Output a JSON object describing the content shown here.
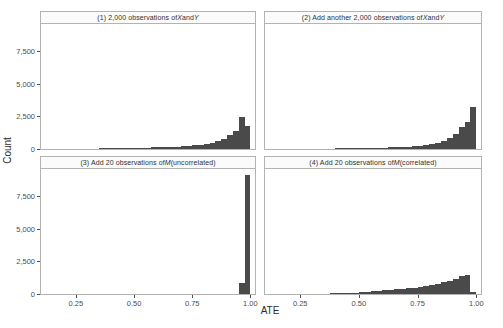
{
  "chart_data": {
    "type": "bar",
    "title": "",
    "xlabel": "ATE",
    "ylabel": "Count",
    "xlim": [
      0.1,
      1.02
    ],
    "ylim": [
      0,
      9600
    ],
    "grid": false,
    "legend": "none",
    "facet_layout": "2x2",
    "x_ticks": [
      0.25,
      0.5,
      0.75,
      1.0
    ],
    "x_tick_labels": [
      "0.25",
      "0.50",
      "0.75",
      "1.00"
    ],
    "y_ticks": [
      0,
      2500,
      5000,
      7500
    ],
    "y_tick_labels": [
      "0",
      "2,500",
      "5,000",
      "7,500"
    ],
    "bar_color": "#4a4a4a",
    "panels": [
      {
        "id": "panel-1",
        "title_prefix": "(1) 2,000 observations of ",
        "title_italic_1": "X",
        "title_mid": " and ",
        "title_italic_2": "Y",
        "title_suffix": "",
        "title_plain": "(1) 2,000 observations of X and Y",
        "bin_width": 0.025,
        "bin_starts": [
          0.35,
          0.375,
          0.4,
          0.425,
          0.45,
          0.475,
          0.5,
          0.525,
          0.55,
          0.575,
          0.6,
          0.625,
          0.65,
          0.675,
          0.7,
          0.725,
          0.75,
          0.775,
          0.8,
          0.825,
          0.85,
          0.875,
          0.9,
          0.925,
          0.95,
          0.975
        ],
        "values": [
          30,
          40,
          55,
          60,
          70,
          80,
          90,
          100,
          110,
          120,
          135,
          150,
          165,
          185,
          210,
          240,
          280,
          330,
          400,
          500,
          620,
          800,
          1050,
          1400,
          2450,
          1800
        ]
      },
      {
        "id": "panel-2",
        "title_prefix": "(2) Add another 2,000 observations of ",
        "title_italic_1": "X",
        "title_mid": " and ",
        "title_italic_2": "Y",
        "title_suffix": "",
        "title_plain": "(2) Add another 2,000 observations of X and Y",
        "bin_width": 0.025,
        "bin_starts": [
          0.4,
          0.425,
          0.45,
          0.475,
          0.5,
          0.525,
          0.55,
          0.575,
          0.6,
          0.625,
          0.65,
          0.675,
          0.7,
          0.725,
          0.75,
          0.775,
          0.8,
          0.825,
          0.85,
          0.875,
          0.9,
          0.925,
          0.95,
          0.975
        ],
        "values": [
          25,
          35,
          45,
          55,
          65,
          75,
          85,
          95,
          110,
          125,
          140,
          160,
          185,
          215,
          255,
          310,
          390,
          500,
          650,
          870,
          1180,
          1680,
          2050,
          3200
        ]
      },
      {
        "id": "panel-3",
        "title_prefix": "(3) Add 20 observations of ",
        "title_italic_1": "M",
        "title_mid": " (uncorrelated)",
        "title_italic_2": "",
        "title_suffix": "",
        "title_plain": "(3) Add 20 observations of M (uncorrelated)",
        "bin_width": 0.025,
        "bin_starts": [
          0.95,
          0.975
        ],
        "values": [
          850,
          9150
        ]
      },
      {
        "id": "panel-4",
        "title_prefix": "(4) Add 20 observations of ",
        "title_italic_1": "M",
        "title_mid": " (correlated)",
        "title_italic_2": "",
        "title_suffix": "",
        "title_plain": "(4) Add 20 observations of M (correlated)",
        "bin_width": 0.025,
        "bin_starts": [
          0.375,
          0.4,
          0.425,
          0.45,
          0.475,
          0.5,
          0.525,
          0.55,
          0.575,
          0.6,
          0.625,
          0.65,
          0.675,
          0.7,
          0.725,
          0.75,
          0.775,
          0.8,
          0.825,
          0.85,
          0.875,
          0.9,
          0.925,
          0.95,
          0.975
        ],
        "values": [
          30,
          45,
          60,
          80,
          110,
          150,
          190,
          230,
          265,
          300,
          330,
          360,
          395,
          430,
          470,
          520,
          590,
          680,
          790,
          900,
          1020,
          1180,
          1420,
          1450,
          120
        ]
      }
    ]
  }
}
